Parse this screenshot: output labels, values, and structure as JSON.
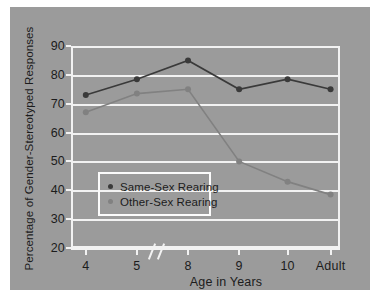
{
  "chart_data": {
    "type": "line",
    "title": "",
    "xlabel": "Age in Years",
    "ylabel": "Percentage of Gender-Stereotyped Responses",
    "categories": [
      "4",
      "5",
      "8",
      "9",
      "10",
      "Adult"
    ],
    "axis_break_after_category": "5",
    "ylim": [
      20,
      90
    ],
    "yticks": [
      90,
      80,
      70,
      60,
      50,
      40,
      30,
      20
    ],
    "grid": true,
    "legend_position": "inside-lower-left",
    "series": [
      {
        "name": "Same-Sex Rearing",
        "color": "#3a3a3a",
        "values": [
          73,
          78.5,
          85,
          75,
          78.5,
          75
        ]
      },
      {
        "name": "Other-Sex Rearing",
        "color": "#818181",
        "values": [
          67,
          73.5,
          75,
          50,
          43,
          38.5
        ]
      }
    ]
  },
  "legend": {
    "items": [
      {
        "label": "Same-Sex Rearing",
        "color": "#3a3a3a"
      },
      {
        "label": "Other-Sex Rearing",
        "color": "#818181"
      }
    ]
  },
  "colors": {
    "page_background": "#ffffff",
    "panel_background": "#9b9b9b",
    "grid": "#f2f2f2",
    "text": "#1c1c1c",
    "series_dark": "#3a3a3a",
    "series_light": "#818181"
  }
}
